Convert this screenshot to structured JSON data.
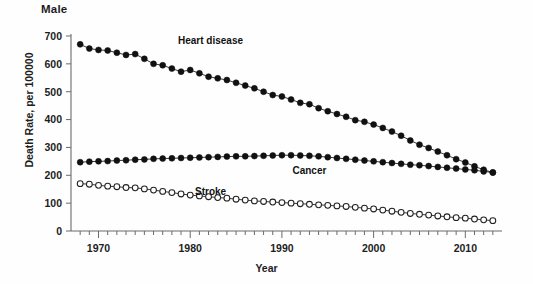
{
  "panel": {
    "title": "Male"
  },
  "axes": {
    "ylabel": "Death Rate, per 100000",
    "xlabel": "Year",
    "yticks": [
      0,
      100,
      200,
      300,
      400,
      500,
      600,
      700
    ],
    "xticks": [
      1970,
      1980,
      1990,
      2000,
      2010
    ]
  },
  "series_labels": {
    "heart": "Heart disease",
    "cancer": "Cancer",
    "stroke": "Stroke"
  },
  "colors": {
    "ink": "#111111",
    "axis": "#6b6b6b",
    "open_fill": "#ffffff"
  },
  "chart_data": {
    "type": "scatter",
    "title": "Male",
    "xlabel": "Year",
    "ylabel": "Death Rate, per 100000",
    "xlim": [
      1967,
      2014
    ],
    "ylim": [
      0,
      700
    ],
    "grid": false,
    "legend": "inline-annotations",
    "x": [
      1968,
      1969,
      1970,
      1971,
      1972,
      1973,
      1974,
      1975,
      1976,
      1977,
      1978,
      1979,
      1980,
      1981,
      1982,
      1983,
      1984,
      1985,
      1986,
      1987,
      1988,
      1989,
      1990,
      1991,
      1992,
      1993,
      1994,
      1995,
      1996,
      1997,
      1998,
      1999,
      2000,
      2001,
      2002,
      2003,
      2004,
      2005,
      2006,
      2007,
      2008,
      2009,
      2010,
      2011,
      2012,
      2013
    ],
    "series": [
      {
        "name": "Heart disease",
        "marker": "filled-circle",
        "values": [
          670,
          655,
          650,
          648,
          640,
          632,
          635,
          618,
          600,
          595,
          583,
          572,
          578,
          566,
          554,
          548,
          542,
          532,
          522,
          512,
          500,
          488,
          483,
          472,
          460,
          455,
          441,
          430,
          420,
          410,
          398,
          392,
          382,
          370,
          357,
          342,
          325,
          310,
          298,
          285,
          272,
          258,
          246,
          232,
          220,
          210
        ]
      },
      {
        "name": "Cancer",
        "marker": "filled-circle",
        "values": [
          247,
          249,
          250,
          251,
          253,
          254,
          256,
          257,
          259,
          260,
          261,
          262,
          263,
          264,
          265,
          266,
          267,
          268,
          268,
          269,
          270,
          271,
          272,
          272,
          271,
          270,
          268,
          265,
          262,
          259,
          256,
          253,
          250,
          247,
          244,
          241,
          238,
          236,
          233,
          230,
          227,
          224,
          221,
          218,
          214,
          210
        ]
      },
      {
        "name": "Stroke",
        "marker": "open-circle",
        "values": [
          170,
          168,
          164,
          161,
          159,
          156,
          155,
          151,
          147,
          142,
          138,
          133,
          129,
          126,
          123,
          120,
          118,
          114,
          111,
          108,
          106,
          104,
          102,
          100,
          98,
          96,
          94,
          92,
          90,
          88,
          85,
          82,
          79,
          75,
          71,
          67,
          63,
          60,
          57,
          54,
          51,
          48,
          46,
          43,
          40,
          37
        ]
      }
    ]
  }
}
